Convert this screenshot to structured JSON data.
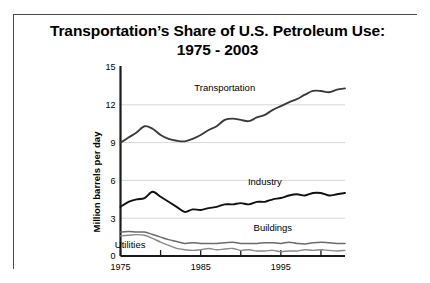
{
  "title": {
    "line1": "Transportation’s Share of U.S. Petroleum Use:",
    "line2": "1975 - 2003"
  },
  "chart_data": {
    "type": "line",
    "title": "Transportation’s Share of U.S. Petroleum Use: 1975 - 2003",
    "xlabel": "",
    "ylabel": "Million barrels per day",
    "xlim": [
      1975,
      2003
    ],
    "ylim": [
      0,
      15
    ],
    "grid": true,
    "legend_position": "inline-labels",
    "yticks": [
      0,
      3,
      6,
      9,
      12,
      15
    ],
    "ytick_labels": [
      "0",
      "3",
      "6",
      "9",
      "12",
      "15"
    ],
    "xticks": [
      1975,
      1980,
      1985,
      1990,
      1995,
      2000
    ],
    "xtick_labels": [
      "1975",
      "",
      "1985",
      "",
      "1995",
      ""
    ],
    "x": [
      1975,
      1976,
      1977,
      1978,
      1979,
      1980,
      1981,
      1982,
      1983,
      1984,
      1985,
      1986,
      1987,
      1988,
      1989,
      1990,
      1991,
      1992,
      1993,
      1994,
      1995,
      1996,
      1997,
      1998,
      1999,
      2000,
      2001,
      2002,
      2003
    ],
    "series": [
      {
        "name": "Transportation",
        "color": "#3a3a3a",
        "width": 1.9,
        "label_x": 1988,
        "label_y": 13.1,
        "values": [
          9.0,
          9.4,
          9.8,
          10.3,
          10.1,
          9.6,
          9.3,
          9.15,
          9.1,
          9.3,
          9.6,
          10.0,
          10.3,
          10.8,
          10.9,
          10.8,
          10.7,
          11.0,
          11.2,
          11.6,
          11.9,
          12.2,
          12.45,
          12.8,
          13.1,
          13.1,
          13.0,
          13.2,
          13.3
        ]
      },
      {
        "name": "Industry",
        "color": "#111111",
        "width": 1.9,
        "label_x": 1993,
        "label_y": 5.6,
        "values": [
          3.9,
          4.3,
          4.5,
          4.6,
          5.1,
          4.7,
          4.3,
          3.9,
          3.5,
          3.7,
          3.65,
          3.8,
          3.9,
          4.1,
          4.1,
          4.2,
          4.1,
          4.3,
          4.3,
          4.5,
          4.6,
          4.8,
          4.9,
          4.8,
          5.0,
          5.0,
          4.8,
          4.9,
          5.0
        ]
      },
      {
        "name": "Buildings",
        "color": "#6b6b6b",
        "width": 1.5,
        "label_x": 1994,
        "label_y": 1.95,
        "values": [
          1.9,
          1.95,
          1.9,
          1.9,
          1.7,
          1.5,
          1.3,
          1.15,
          1.0,
          1.05,
          1.0,
          1.0,
          1.0,
          1.05,
          1.1,
          1.0,
          1.0,
          1.0,
          1.05,
          1.05,
          1.0,
          1.1,
          1.0,
          0.95,
          1.05,
          1.1,
          1.05,
          1.0,
          1.0
        ]
      },
      {
        "name": "Utilities",
        "color": "#8a8a8a",
        "width": 1.4,
        "label_x": 1976.2,
        "label_y": 0.62,
        "values": [
          1.6,
          1.65,
          1.7,
          1.65,
          1.4,
          1.1,
          0.85,
          0.6,
          0.5,
          0.45,
          0.5,
          0.6,
          0.5,
          0.55,
          0.6,
          0.45,
          0.5,
          0.4,
          0.4,
          0.45,
          0.35,
          0.4,
          0.4,
          0.5,
          0.45,
          0.5,
          0.45,
          0.4,
          0.45
        ]
      }
    ]
  }
}
